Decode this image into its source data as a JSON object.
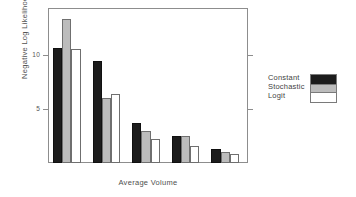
{
  "chart_data": {
    "type": "bar",
    "title": "",
    "xlabel": "Average Volume",
    "ylabel": "Negative Log Likelihood",
    "categories": [
      "1",
      "2",
      "3",
      "4",
      "5"
    ],
    "series": [
      {
        "name": "Constant",
        "color": "#1c1c1c",
        "values": [
          10.7,
          9.5,
          3.7,
          2.5,
          1.3
        ]
      },
      {
        "name": "Stochastic",
        "color": "#bcbcbc",
        "values": [
          13.4,
          6.0,
          3.0,
          2.5,
          1.0
        ]
      },
      {
        "name": "Logit",
        "color": "#ffffff",
        "values": [
          10.6,
          6.4,
          2.2,
          1.6,
          0.85
        ]
      }
    ],
    "ylim": [
      0,
      14.3
    ],
    "yticks": [
      5,
      10
    ],
    "ytick_labels": [
      "5",
      "10"
    ],
    "xticks": [],
    "xtick_labels": [],
    "grid": false,
    "legend_position": "right",
    "legend_entries": [
      "Constant",
      "Stochastic",
      "Logit"
    ]
  }
}
